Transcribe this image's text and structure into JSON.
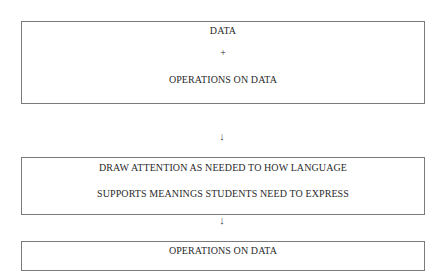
{
  "diagram": {
    "box1": {
      "line1": "DATA",
      "line2": "+",
      "line3": "OPERATIONS ON DATA"
    },
    "arrow1": "↓",
    "box2": {
      "line1": "DRAW ATTENTION AS NEEDED TO HOW LANGUAGE",
      "line2": "SUPPORTS MEANINGS STUDENTS NEED TO EXPRESS"
    },
    "arrow2": "↓",
    "box3": {
      "line1": "OPERATIONS ON DATA"
    }
  }
}
